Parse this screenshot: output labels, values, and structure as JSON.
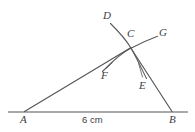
{
  "figure": {
    "kind": "geometry-construction-diagram",
    "background_color": "#ffffff",
    "stroke_color": "#55555a",
    "label_color": "#3d3d42",
    "width": 195,
    "height": 132,
    "points": {
      "A": {
        "label": "A",
        "x": 24,
        "y": 112,
        "label_x": 20,
        "label_y": 115
      },
      "B": {
        "label": "B",
        "x": 172,
        "y": 112,
        "label_x": 170,
        "label_y": 115
      },
      "C": {
        "label": "C",
        "x": 130,
        "y": 48,
        "label_x": 128,
        "label_y": 28
      },
      "D": {
        "label": "D",
        "x": 112,
        "y": 24,
        "label_x": 104,
        "label_y": 10
      },
      "E": {
        "label": "E",
        "x": 147,
        "y": 79,
        "label_x": 141,
        "label_y": 80
      },
      "F": {
        "label": "F",
        "x": 104,
        "y": 72,
        "label_x": 103,
        "label_y": 69
      },
      "G": {
        "label": "G",
        "x": 157,
        "y": 36,
        "label_x": 160,
        "label_y": 27
      }
    },
    "measurements": {
      "base_length": "6 cm"
    },
    "segments": [
      {
        "name": "base-line-AB",
        "from": "A-extended",
        "to": "B-extended"
      },
      {
        "name": "segment-AC",
        "from": "A",
        "to": "C"
      },
      {
        "name": "segment-CB",
        "from": "C",
        "to": "B"
      }
    ],
    "arcs": [
      {
        "name": "arc-DE",
        "from": "D",
        "through": "C",
        "to": "E"
      },
      {
        "name": "arc-FG",
        "from": "F",
        "through": "C",
        "to": "G"
      }
    ]
  }
}
